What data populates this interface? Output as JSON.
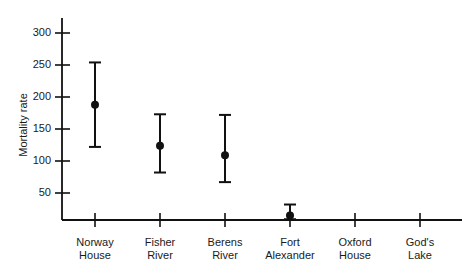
{
  "chart_data": {
    "type": "scatter",
    "title": "",
    "subtitle": "",
    "xlabel": "",
    "ylabel": "Mortality rate",
    "categories": [
      "Norway House",
      "Fisher River",
      "Berens River",
      "Fort Alexander",
      "Oxford House",
      "God's Lake"
    ],
    "category_lines": [
      [
        "Norway",
        "House"
      ],
      [
        "Fisher",
        "River"
      ],
      [
        "Berens",
        "River"
      ],
      [
        "Fort",
        "Alexander"
      ],
      [
        "Oxford",
        "House"
      ],
      [
        "God's",
        "Lake"
      ]
    ],
    "y_ticks": [
      50,
      100,
      150,
      200,
      250,
      300
    ],
    "y_tick_labels": [
      "50",
      "100",
      "150",
      "200",
      "250",
      "300"
    ],
    "ylim": [
      16,
      330
    ],
    "xlim": [
      0,
      7
    ],
    "grid": false,
    "legend": false,
    "legend_position": "none",
    "series": [
      {
        "name": "Mortality rate",
        "marker": "filled-circle",
        "error_bars": true,
        "values": [
          188,
          124,
          109,
          15,
          null,
          null
        ],
        "lower": [
          122,
          82,
          67,
          9,
          null,
          null
        ],
        "upper": [
          254,
          173,
          172,
          32,
          null,
          null
        ]
      }
    ],
    "points": [
      {
        "category": "Norway House",
        "value": 188,
        "lower": 122,
        "upper": 254,
        "plotted": true
      },
      {
        "category": "Fisher River",
        "value": 124,
        "lower": 82,
        "upper": 173,
        "plotted": true
      },
      {
        "category": "Berens River",
        "value": 109,
        "lower": 67,
        "upper": 172,
        "plotted": true
      },
      {
        "category": "Fort Alexander",
        "value": 15,
        "lower": 9,
        "upper": 32,
        "plotted": true
      },
      {
        "category": "Oxford House",
        "value": null,
        "lower": null,
        "upper": null,
        "plotted": false
      },
      {
        "category": "God's Lake",
        "value": null,
        "lower": null,
        "upper": null,
        "plotted": false
      }
    ],
    "colors": {
      "marker": "#111111",
      "error_bar": "#111111",
      "axis": "#111111",
      "background": "#ffffff",
      "text": "#1a1a1a"
    }
  }
}
